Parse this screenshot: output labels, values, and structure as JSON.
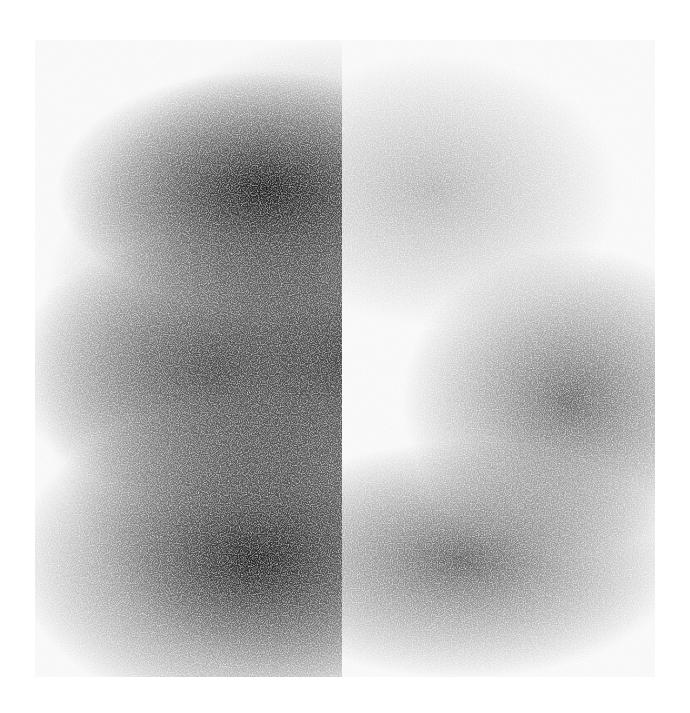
{
  "artwork": {
    "description": "Abstract spray-paint artwork: circular form split by a vertical line, with darker left half and lighter right half divided into wedge sectors",
    "colors": {
      "background": "#ffffff",
      "dark": "#1a1a1a",
      "mid": "#6a6a6a",
      "light": "#c8c8c8"
    }
  }
}
